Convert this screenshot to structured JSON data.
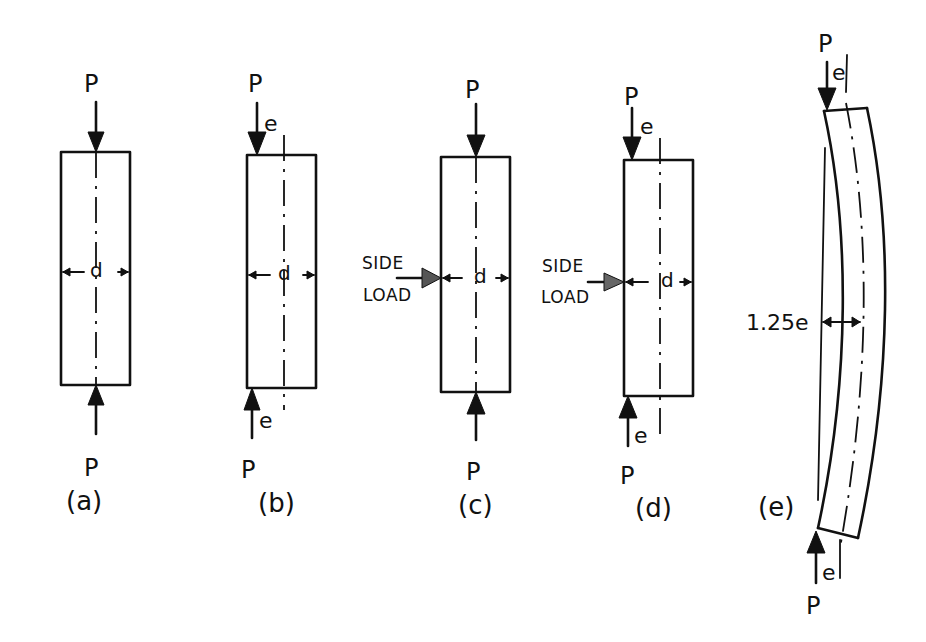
{
  "figure": {
    "panels": [
      {
        "id": "a",
        "caption": "(a)",
        "top_load": "P",
        "bottom_load": "P",
        "width_label": "d",
        "eccentricity_top": null,
        "eccentricity_bottom": null,
        "side_load": null
      },
      {
        "id": "b",
        "caption": "(b)",
        "top_load": "P",
        "bottom_load": "P",
        "width_label": "d",
        "eccentricity_top": "e",
        "eccentricity_bottom": "e",
        "side_load": null
      },
      {
        "id": "c",
        "caption": "(c)",
        "top_load": "P",
        "bottom_load": "P",
        "width_label": "d",
        "eccentricity_top": null,
        "eccentricity_bottom": null,
        "side_load": {
          "line1": "SIDE",
          "line2": "LOAD"
        }
      },
      {
        "id": "d",
        "caption": "(d)",
        "top_load": "P",
        "bottom_load": "P",
        "width_label": "d",
        "eccentricity_top": "e",
        "eccentricity_bottom": "e",
        "side_load": {
          "line1": "SIDE",
          "line2": "LOAD"
        }
      },
      {
        "id": "e",
        "caption": "(e)",
        "top_load": "P",
        "bottom_load": "P",
        "deflection_label": "1.25e",
        "eccentricity_top": "e",
        "eccentricity_bottom": "e",
        "side_load": null
      }
    ]
  },
  "colors": {
    "ink": "#111111",
    "paper": "#ffffff"
  }
}
